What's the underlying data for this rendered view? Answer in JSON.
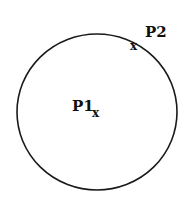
{
  "diagram": {
    "shape": "circle",
    "circle": {
      "cx": 97,
      "cy": 112,
      "rx": 80,
      "ry": 78,
      "stroke": "#1a1a1a"
    },
    "points": [
      {
        "label": "P1",
        "marker": "x",
        "role": "center"
      },
      {
        "label": "P2",
        "marker": "x",
        "role": "point-on-circumference"
      }
    ]
  }
}
